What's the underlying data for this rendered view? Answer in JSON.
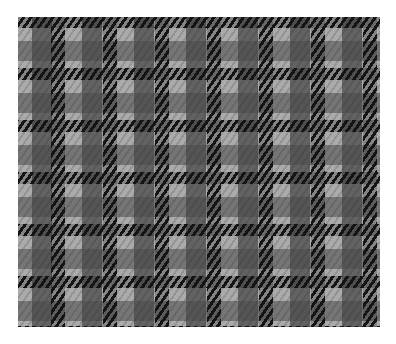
{
  "image": {
    "subject": "fabric swatch",
    "pattern": "glen plaid / houndstooth check",
    "colors": {
      "background": "#ffffff",
      "base_light_gray": "#ababab",
      "medium_gray_check": "#6e6e6e",
      "black_stripes": "#141414"
    },
    "stripe_period_px": 52,
    "stripe_width_px": 14
  }
}
